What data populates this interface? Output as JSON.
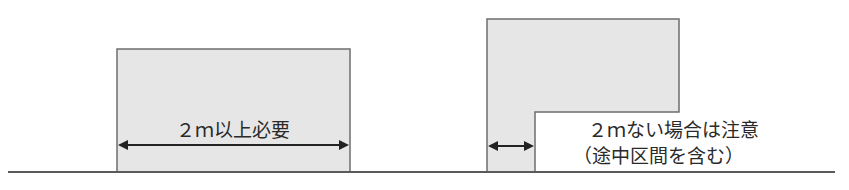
{
  "diagram": {
    "colors": {
      "fill": "#e6e6e6",
      "stroke": "#6e6e6e",
      "ground": "#5a5a5a",
      "arrow": "#222222",
      "text": "#2a2a2a"
    },
    "left_panel": {
      "label": "２ｍ以上必要"
    },
    "right_panel": {
      "label_line1": "２ｍない場合は注意",
      "label_line2": "（途中区間を含む）"
    }
  }
}
